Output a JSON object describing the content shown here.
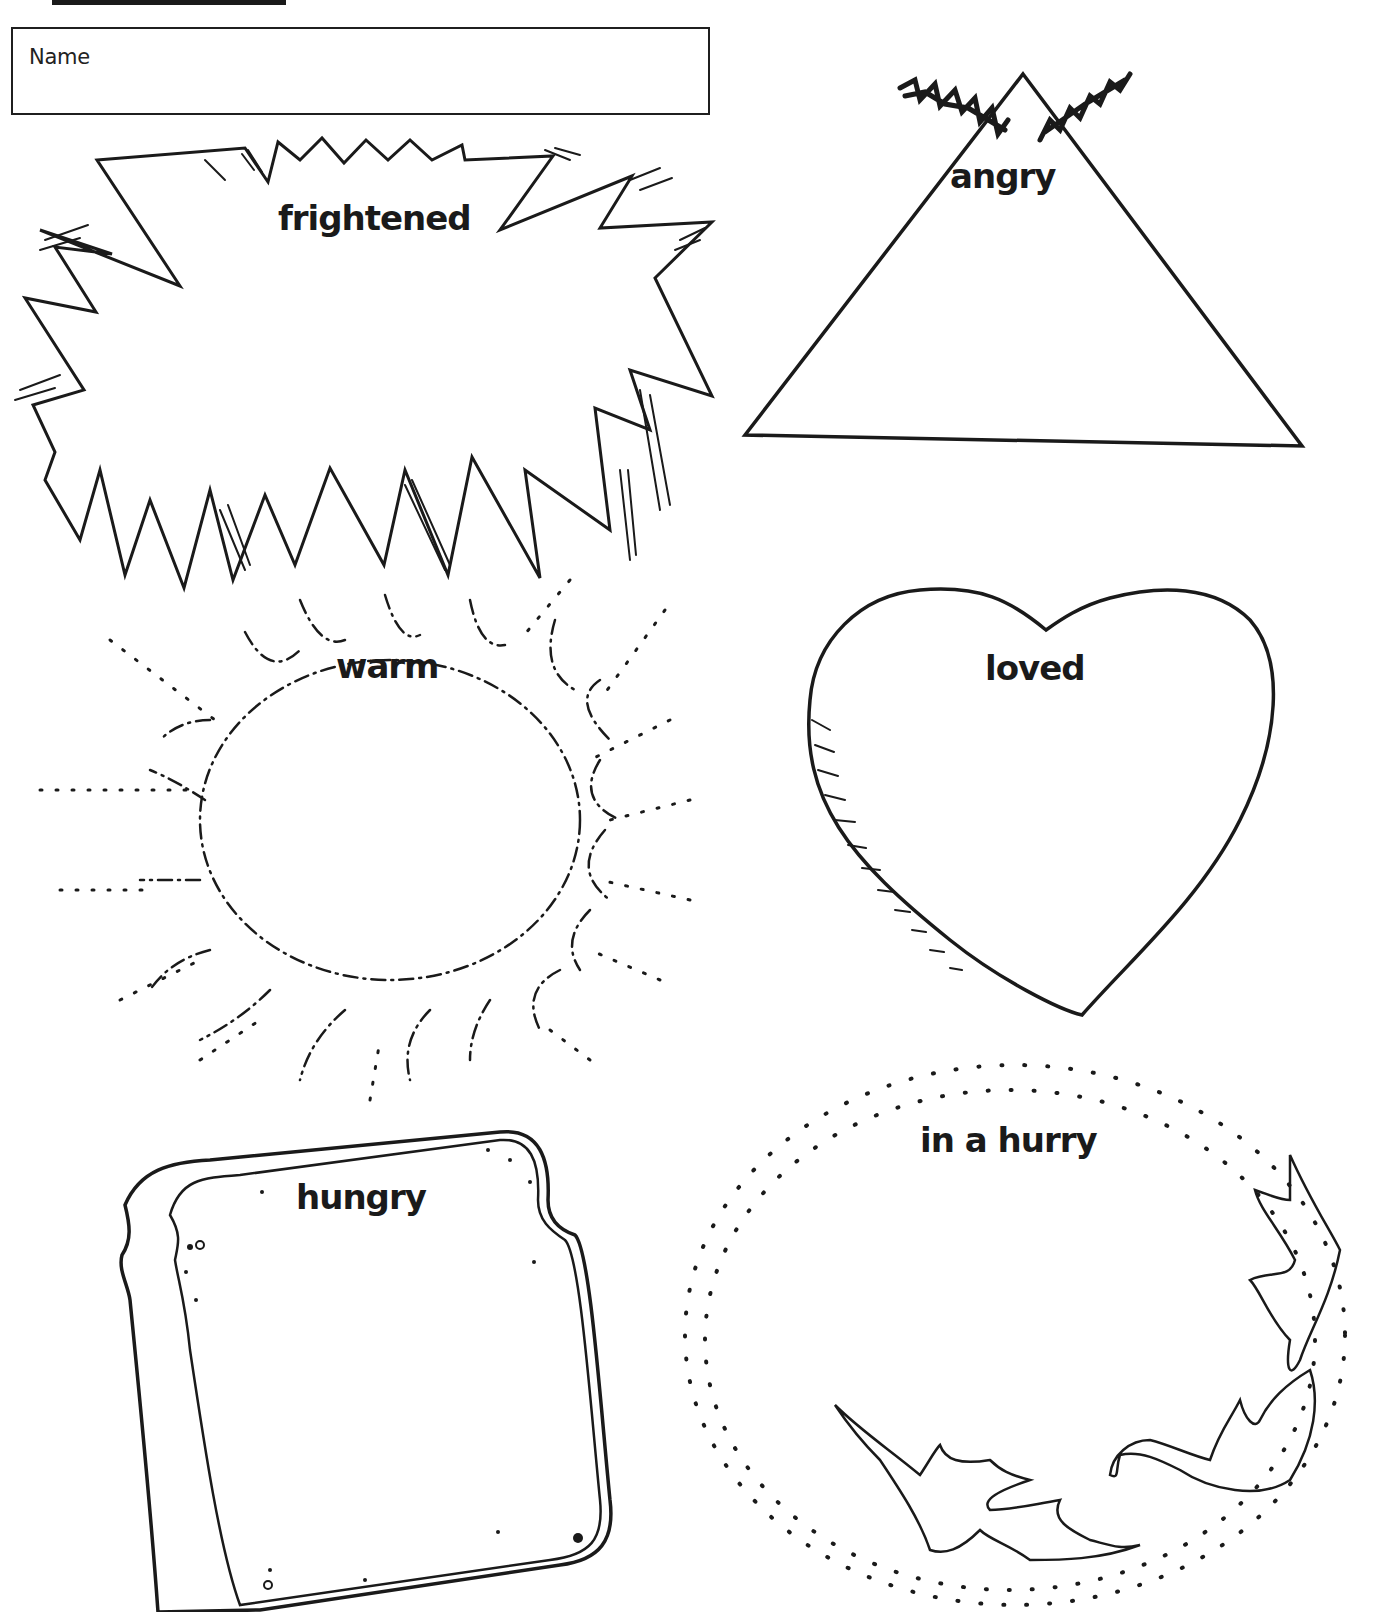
{
  "worksheet": {
    "name_field": {
      "label": "Name",
      "value": ""
    },
    "shapes": [
      {
        "id": "frightened",
        "label": "frightened",
        "shape": "jagged-burst"
      },
      {
        "id": "angry",
        "label": "angry",
        "shape": "volcano-triangle"
      },
      {
        "id": "warm",
        "label": "warm",
        "shape": "sun"
      },
      {
        "id": "loved",
        "label": "loved",
        "shape": "heart"
      },
      {
        "id": "hungry",
        "label": "hungry",
        "shape": "bread-slice"
      },
      {
        "id": "in_a_hurry",
        "label": "in a hurry",
        "shape": "dotted-swirl-with-leaves"
      }
    ]
  },
  "colors": {
    "ink": "#1a1a1a",
    "paper": "#ffffff"
  }
}
